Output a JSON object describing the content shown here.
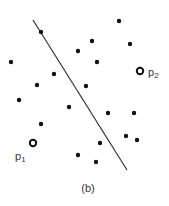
{
  "figure": {
    "caption": "(b)",
    "line": {
      "x1": 33,
      "y1": 20,
      "x2": 127,
      "y2": 170,
      "color": "#333333"
    },
    "dots": [
      {
        "x": 41,
        "y": 32
      },
      {
        "x": 119,
        "y": 21
      },
      {
        "x": 92,
        "y": 41
      },
      {
        "x": 130,
        "y": 44
      },
      {
        "x": 78,
        "y": 51
      },
      {
        "x": 97,
        "y": 62
      },
      {
        "x": 11,
        "y": 62
      },
      {
        "x": 54,
        "y": 74
      },
      {
        "x": 37,
        "y": 85
      },
      {
        "x": 86,
        "y": 86
      },
      {
        "x": 19,
        "y": 100
      },
      {
        "x": 69,
        "y": 107
      },
      {
        "x": 108,
        "y": 113
      },
      {
        "x": 134,
        "y": 113
      },
      {
        "x": 41,
        "y": 124
      },
      {
        "x": 126,
        "y": 136
      },
      {
        "x": 137,
        "y": 140
      },
      {
        "x": 100,
        "y": 143
      },
      {
        "x": 78,
        "y": 155
      },
      {
        "x": 96,
        "y": 162
      }
    ],
    "special_points": [
      {
        "name": "p1",
        "label": "p",
        "subscript": "1",
        "x": 33,
        "y": 143,
        "label_x": 15,
        "label_y": 160
      },
      {
        "name": "p2",
        "label": "p",
        "subscript": "2",
        "x": 140,
        "y": 71,
        "label_x": 148,
        "label_y": 76
      }
    ]
  }
}
